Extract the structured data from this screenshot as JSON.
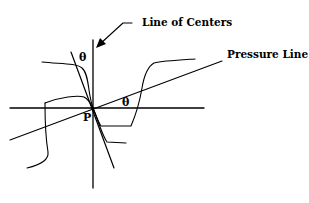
{
  "diagram": {
    "labels": {
      "line_of_centers": "Line of Centers",
      "pressure_line": "Pressure Line",
      "theta_upper": "θ",
      "theta_lower": "θ",
      "pitch_point": "P"
    },
    "colors": {
      "stroke": "#000000",
      "background": "#ffffff"
    }
  }
}
